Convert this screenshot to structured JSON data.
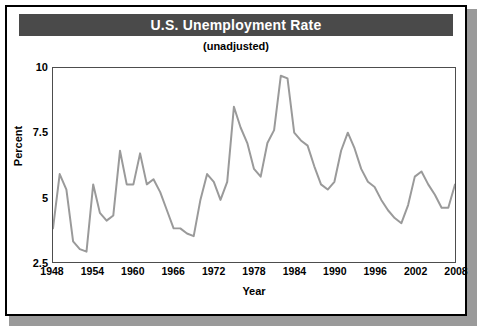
{
  "figure": {
    "title": "U.S. Unemployment Rate",
    "subtitle": "(unadjusted)",
    "title_band_color": "#4a4a4a",
    "title_text_color": "#ffffff",
    "frame_border_color": "#000000",
    "background_color": "#ffffff"
  },
  "chart_data": {
    "type": "line",
    "title": "U.S. Unemployment Rate",
    "subtitle": "(unadjusted)",
    "xlabel": "Year",
    "ylabel": "Percent",
    "xlim": [
      1948,
      2008
    ],
    "ylim": [
      2.5,
      10
    ],
    "xticks": [
      1948,
      1954,
      1960,
      1966,
      1972,
      1978,
      1984,
      1990,
      1996,
      2002,
      2008
    ],
    "yticks": [
      2.5,
      5,
      7.5,
      10
    ],
    "xtick_labels": [
      "1948",
      "1954",
      "1960",
      "1966",
      "1972",
      "1978",
      "1984",
      "1990",
      "1996",
      "2002",
      "2008"
    ],
    "ytick_labels": [
      "2.5",
      "5",
      "7.5",
      "10"
    ],
    "grid": false,
    "legend": false,
    "line_color": "#9a9a9a",
    "line_width": 2,
    "series": [
      {
        "name": "Unemployment Rate",
        "x": [
          1948,
          1949,
          1950,
          1951,
          1952,
          1953,
          1954,
          1955,
          1956,
          1957,
          1958,
          1959,
          1960,
          1961,
          1962,
          1963,
          1964,
          1965,
          1966,
          1967,
          1968,
          1969,
          1970,
          1971,
          1972,
          1973,
          1974,
          1975,
          1976,
          1977,
          1978,
          1979,
          1980,
          1981,
          1982,
          1983,
          1984,
          1985,
          1986,
          1987,
          1988,
          1989,
          1990,
          1991,
          1992,
          1993,
          1994,
          1995,
          1996,
          1997,
          1998,
          1999,
          2000,
          2001,
          2002,
          2003,
          2004,
          2005,
          2006,
          2007,
          2008
        ],
        "values": [
          3.8,
          5.9,
          5.3,
          3.3,
          3.0,
          2.9,
          5.5,
          4.4,
          4.1,
          4.3,
          6.8,
          5.5,
          5.5,
          6.7,
          5.5,
          5.7,
          5.2,
          4.5,
          3.8,
          3.8,
          3.6,
          3.5,
          4.9,
          5.9,
          5.6,
          4.9,
          5.6,
          8.5,
          7.7,
          7.1,
          6.1,
          5.8,
          7.1,
          7.6,
          9.7,
          9.6,
          7.5,
          7.2,
          7.0,
          6.2,
          5.5,
          5.3,
          5.6,
          6.8,
          7.5,
          6.9,
          6.1,
          5.6,
          5.4,
          4.9,
          4.5,
          4.2,
          4.0,
          4.7,
          5.8,
          6.0,
          5.5,
          5.1,
          4.6,
          4.6,
          5.5
        ]
      }
    ]
  },
  "axes": {
    "y_label": "Percent",
    "x_label": "Year"
  }
}
